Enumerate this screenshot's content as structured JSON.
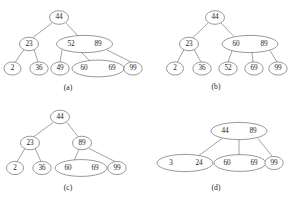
{
  "figure": {
    "name": "b-tree-insertion-deletion-sequence",
    "width": 288,
    "height": 201,
    "background_color": "#ffffff",
    "node_stroke_color": "#6d6d6d",
    "edge_stroke_color": "#7a7a7a",
    "text_color": "#1c1c1c"
  },
  "panels": [
    {
      "id": "a",
      "caption": "(a)",
      "caption_x": 68,
      "caption_y": 88,
      "nodes": [
        {
          "name": "node-a-root-44",
          "keys": "44",
          "cx": 59,
          "cy": 17.5,
          "rx": 9.5,
          "ry": 6.8,
          "keyPositions": [
            59
          ]
        },
        {
          "name": "node-a-23",
          "keys": "23",
          "cx": 29,
          "cy": 44,
          "rx": 9.5,
          "ry": 6.8,
          "keyPositions": [
            29
          ]
        },
        {
          "name": "node-a-52-89",
          "keys": "52 89",
          "cx": 84.5,
          "cy": 44,
          "rx": 28,
          "ry": 8.6,
          "keyPositions": [
            71,
            98
          ]
        },
        {
          "name": "node-a-2",
          "keys": "2",
          "cx": 12.5,
          "cy": 68.5,
          "rx": 8.5,
          "ry": 6.6,
          "keyPositions": [
            12.5
          ]
        },
        {
          "name": "node-a-36",
          "keys": "36",
          "cx": 39,
          "cy": 68.5,
          "rx": 9.2,
          "ry": 6.6,
          "keyPositions": [
            39
          ]
        },
        {
          "name": "node-a-49",
          "keys": "49",
          "cx": 60,
          "cy": 68.5,
          "rx": 9.2,
          "ry": 6.6,
          "keyPositions": [
            60
          ]
        },
        {
          "name": "node-a-60-69",
          "keys": "60 69",
          "cx": 98,
          "cy": 68.5,
          "rx": 26,
          "ry": 8.4,
          "keyPositions": [
            84,
            112
          ]
        },
        {
          "name": "node-a-99",
          "keys": "99",
          "cx": 133,
          "cy": 68.5,
          "rx": 9.2,
          "ry": 6.6,
          "keyPositions": [
            133
          ]
        }
      ],
      "edges": [
        {
          "name": "edge-a-44-23",
          "x1": 52,
          "y1": 23,
          "x2": 33,
          "y2": 37.5
        },
        {
          "name": "edge-a-44-52",
          "x1": 66,
          "y1": 23,
          "x2": 78,
          "y2": 36
        },
        {
          "name": "edge-a-23-2",
          "x1": 24,
          "y1": 49.5,
          "x2": 15,
          "y2": 62.5
        },
        {
          "name": "edge-a-23-36",
          "x1": 34,
          "y1": 49.5,
          "x2": 38,
          "y2": 62
        },
        {
          "name": "edge-a-52-49",
          "x1": 62,
          "y1": 50,
          "x2": 60,
          "y2": 62
        },
        {
          "name": "edge-a-52-60",
          "x1": 80,
          "y1": 51,
          "x2": 90,
          "y2": 61
        },
        {
          "name": "edge-a-89-99",
          "x1": 107,
          "y1": 50,
          "x2": 131,
          "y2": 62
        }
      ]
    },
    {
      "id": "b",
      "caption": "(b)",
      "caption_x": 216,
      "caption_y": 87,
      "nodes": [
        {
          "name": "node-b-root-44",
          "keys": "44",
          "cx": 215,
          "cy": 17.5,
          "rx": 9.5,
          "ry": 6.8,
          "keyPositions": [
            215
          ]
        },
        {
          "name": "node-b-23",
          "keys": "23",
          "cx": 189,
          "cy": 44,
          "rx": 9.5,
          "ry": 6.8,
          "keyPositions": [
            189
          ]
        },
        {
          "name": "node-b-60-89",
          "keys": "60 89",
          "cx": 250,
          "cy": 44,
          "rx": 28,
          "ry": 8.6,
          "keyPositions": [
            236,
            264
          ]
        },
        {
          "name": "node-b-2",
          "keys": "2",
          "cx": 175,
          "cy": 68.5,
          "rx": 8.5,
          "ry": 6.6,
          "keyPositions": [
            175
          ]
        },
        {
          "name": "node-b-36",
          "keys": "36",
          "cx": 202,
          "cy": 68.5,
          "rx": 9.2,
          "ry": 6.6,
          "keyPositions": [
            202
          ]
        },
        {
          "name": "node-b-52",
          "keys": "52",
          "cx": 228,
          "cy": 68.5,
          "rx": 9.2,
          "ry": 6.6,
          "keyPositions": [
            228
          ]
        },
        {
          "name": "node-b-69",
          "keys": "69",
          "cx": 254,
          "cy": 68.5,
          "rx": 9.2,
          "ry": 6.6,
          "keyPositions": [
            254
          ]
        },
        {
          "name": "node-b-99",
          "keys": "99",
          "cx": 278,
          "cy": 68.5,
          "rx": 9.2,
          "ry": 6.6,
          "keyPositions": [
            278
          ]
        }
      ],
      "edges": [
        {
          "name": "edge-b-44-23",
          "x1": 208,
          "y1": 23,
          "x2": 193,
          "y2": 37.5
        },
        {
          "name": "edge-b-44-60",
          "x1": 221,
          "y1": 23,
          "x2": 234,
          "y2": 36.5
        },
        {
          "name": "edge-b-23-2",
          "x1": 184,
          "y1": 49.5,
          "x2": 177,
          "y2": 62.5
        },
        {
          "name": "edge-b-23-36",
          "x1": 194,
          "y1": 49.5,
          "x2": 201,
          "y2": 62
        },
        {
          "name": "edge-b-60-52",
          "x1": 232,
          "y1": 51,
          "x2": 228,
          "y2": 62
        },
        {
          "name": "edge-b-60-69",
          "x1": 252,
          "y1": 52.5,
          "x2": 253,
          "y2": 62
        },
        {
          "name": "edge-b-89-99",
          "x1": 270,
          "y1": 50.5,
          "x2": 277,
          "y2": 62
        }
      ]
    },
    {
      "id": "c",
      "caption": "(c)",
      "caption_x": 68,
      "caption_y": 188,
      "nodes": [
        {
          "name": "node-c-root-44",
          "keys": "44",
          "cx": 60,
          "cy": 117,
          "rx": 9.5,
          "ry": 6.8,
          "keyPositions": [
            60
          ]
        },
        {
          "name": "node-c-23",
          "keys": "23",
          "cx": 30,
          "cy": 143,
          "rx": 9.5,
          "ry": 6.8,
          "keyPositions": [
            30
          ]
        },
        {
          "name": "node-c-89",
          "keys": "89",
          "cx": 82,
          "cy": 143,
          "rx": 9.5,
          "ry": 6.8,
          "keyPositions": [
            82
          ]
        },
        {
          "name": "node-c-2",
          "keys": "2",
          "cx": 15,
          "cy": 168,
          "rx": 8.5,
          "ry": 6.6,
          "keyPositions": [
            15
          ]
        },
        {
          "name": "node-c-36",
          "keys": "36",
          "cx": 42,
          "cy": 168,
          "rx": 9.2,
          "ry": 6.6,
          "keyPositions": [
            42
          ]
        },
        {
          "name": "node-c-60-69",
          "keys": "60 69",
          "cx": 81,
          "cy": 168,
          "rx": 26,
          "ry": 8.4,
          "keyPositions": [
            68,
            95
          ]
        },
        {
          "name": "node-c-99",
          "keys": "99",
          "cx": 117,
          "cy": 168,
          "rx": 9.2,
          "ry": 6.6,
          "keyPositions": [
            117
          ]
        }
      ],
      "edges": [
        {
          "name": "edge-c-44-23",
          "x1": 53,
          "y1": 122.5,
          "x2": 34,
          "y2": 136.5
        },
        {
          "name": "edge-c-44-89",
          "x1": 67,
          "y1": 122.5,
          "x2": 78,
          "y2": 136.5
        },
        {
          "name": "edge-c-23-2",
          "x1": 25,
          "y1": 148.5,
          "x2": 17,
          "y2": 161.5
        },
        {
          "name": "edge-c-23-36",
          "x1": 35,
          "y1": 148.5,
          "x2": 41,
          "y2": 161.5
        },
        {
          "name": "edge-c-89-60",
          "x1": 79,
          "y1": 149.5,
          "x2": 74,
          "y2": 161
        },
        {
          "name": "edge-c-89-99",
          "x1": 89,
          "y1": 148.5,
          "x2": 115,
          "y2": 161.5
        }
      ]
    },
    {
      "id": "d",
      "caption": "(d)",
      "caption_x": 216,
      "caption_y": 188,
      "nodes": [
        {
          "name": "node-d-root-44-89",
          "keys": "44 89",
          "cx": 239,
          "cy": 131,
          "rx": 28,
          "ry": 8.6,
          "keyPositions": [
            225,
            253
          ]
        },
        {
          "name": "node-d-3-24",
          "keys": "3 24",
          "cx": 185,
          "cy": 163,
          "rx": 28,
          "ry": 8.6,
          "keyPositions": [
            171,
            199
          ]
        },
        {
          "name": "node-d-60-69",
          "keys": "60 69",
          "cx": 240,
          "cy": 163,
          "rx": 26,
          "ry": 8.4,
          "keyPositions": [
            227,
            254
          ]
        },
        {
          "name": "node-d-99",
          "keys": "99",
          "cx": 274,
          "cy": 163,
          "rx": 9.2,
          "ry": 6.6,
          "keyPositions": [
            274
          ]
        }
      ],
      "edges": [
        {
          "name": "edge-d-44-3",
          "x1": 222,
          "y1": 138.5,
          "x2": 199,
          "y2": 155.5
        },
        {
          "name": "edge-d-44-60",
          "x1": 239,
          "y1": 139.5,
          "x2": 239,
          "y2": 155
        },
        {
          "name": "edge-d-89-99",
          "x1": 258,
          "y1": 138.5,
          "x2": 272,
          "y2": 156
        }
      ]
    }
  ]
}
